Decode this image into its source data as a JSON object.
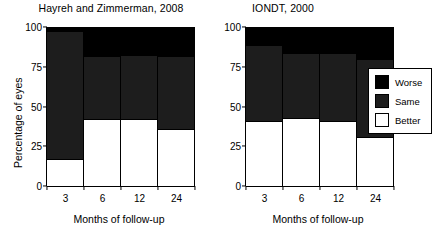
{
  "chart_data": [
    {
      "type": "bar",
      "title": "Hayreh and Zimmerman, 2008",
      "xlabel": "Months of follow-up",
      "ylabel": "Percentage of eyes",
      "categories": [
        "3",
        "6",
        "12",
        "24"
      ],
      "ylim": [
        0,
        100
      ],
      "yticks": [
        "0",
        "25",
        "50",
        "75",
        "100"
      ],
      "grid": false,
      "stacked": true,
      "legend_position": "right-outside",
      "series": [
        {
          "name": "Better",
          "color": "#ffffff",
          "values": [
            17,
            42,
            42,
            36
          ]
        },
        {
          "name": "Same",
          "color": "#1d1d1d",
          "values": [
            80,
            39,
            40,
            45
          ]
        },
        {
          "name": "Worse",
          "color": "#000000",
          "values": [
            3,
            19,
            18,
            19
          ]
        }
      ]
    },
    {
      "type": "bar",
      "title": "IONDT, 2000",
      "xlabel": "Months of follow-up",
      "ylabel": "Percentage of eyes",
      "categories": [
        "3",
        "6",
        "12",
        "24"
      ],
      "ylim": [
        0,
        100
      ],
      "yticks": [
        "0",
        "25",
        "50",
        "75",
        "100"
      ],
      "grid": false,
      "stacked": true,
      "legend_position": "right-outside",
      "series": [
        {
          "name": "Better",
          "color": "#ffffff",
          "values": [
            41,
            43,
            41,
            31
          ]
        },
        {
          "name": "Same",
          "color": "#1d1d1d",
          "values": [
            47,
            40,
            42,
            48
          ]
        },
        {
          "name": "Worse",
          "color": "#000000",
          "values": [
            12,
            17,
            17,
            21
          ]
        }
      ]
    }
  ],
  "panels": {
    "left": {
      "title": "Hayreh and Zimmerman, 2008",
      "ylabel": "Percentage of eyes",
      "xlabel": "Months of follow-up",
      "yticks": [
        "100",
        "75",
        "50",
        "25",
        "0"
      ],
      "xticks": [
        "3",
        "6",
        "12",
        "24"
      ]
    },
    "right": {
      "title": "IONDT, 2000",
      "xlabel": "Months of follow-up",
      "yticks": [
        "100",
        "75",
        "50",
        "25",
        "0"
      ],
      "xticks": [
        "3",
        "6",
        "12",
        "24"
      ]
    }
  },
  "legend": {
    "items": [
      {
        "label": "Worse",
        "color": "#000000"
      },
      {
        "label": "Same",
        "color": "#1d1d1d"
      },
      {
        "label": "Better",
        "color": "#ffffff"
      }
    ]
  }
}
